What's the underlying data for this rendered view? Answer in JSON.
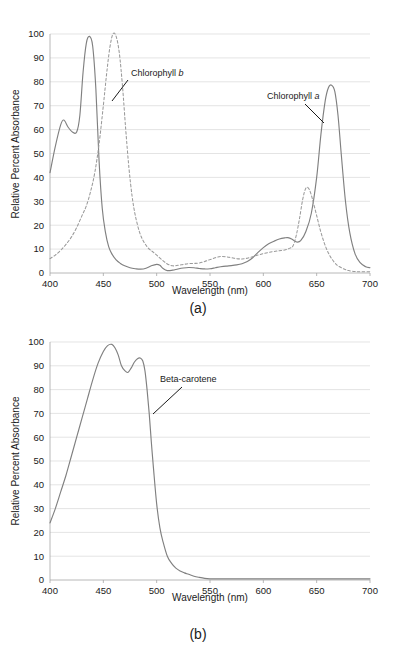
{
  "figure": {
    "panels": [
      {
        "id": "a",
        "caption": "(a)",
        "xlabel": "Wavelength (nm)",
        "ylabel": "Relative Percent Absorbance",
        "xticks": [
          400,
          450,
          500,
          550,
          600,
          650,
          700
        ],
        "yticks": [
          0,
          10,
          20,
          30,
          40,
          50,
          60,
          70,
          80,
          90,
          100
        ],
        "annotations": [
          {
            "name": "chlorophyll-b",
            "text_prefix": "Chlorophyll ",
            "text_italic": "b",
            "text_full": "Chlorophyll b",
            "label_x": 131,
            "label_y": 76,
            "leader": [
              [
                128,
                80
              ],
              [
                112,
                101
              ]
            ]
          },
          {
            "name": "chlorophyll-a",
            "text_prefix": "Chlorophyll ",
            "text_italic": "a",
            "text_full": "Chlorophyll a",
            "label_x": 267,
            "label_y": 99,
            "leader": [
              [
                305,
                104
              ],
              [
                324,
                123
              ]
            ]
          }
        ]
      },
      {
        "id": "b",
        "caption": "(b)",
        "xlabel": "Wavelength (nm)",
        "ylabel": "Relative Percent Absorbance",
        "xticks": [
          400,
          450,
          500,
          550,
          600,
          650,
          700
        ],
        "yticks": [
          0,
          10,
          20,
          30,
          40,
          50,
          60,
          70,
          80,
          90,
          100
        ],
        "annotations": [
          {
            "name": "beta-carotene",
            "text_prefix": "Beta-carotene",
            "text_italic": "",
            "text_full": "Beta-carotene",
            "label_x": 160,
            "label_y": 382,
            "leader": [
              [
                182,
                387
              ],
              [
                153,
                414
              ]
            ]
          }
        ]
      }
    ]
  },
  "chart_data": [
    {
      "type": "line",
      "panel": "a",
      "title": "",
      "xlabel": "Wavelength (nm)",
      "ylabel": "Relative Percent Absorbance",
      "xlim": [
        400,
        700
      ],
      "ylim": [
        0,
        100
      ],
      "grid": true,
      "legend_position": "annotated-inline",
      "series": [
        {
          "name": "Chlorophyll a",
          "style": "solid",
          "color": "#808080",
          "x": [
            400,
            405,
            410,
            413,
            417,
            421,
            425,
            428,
            431,
            434,
            437,
            440,
            443,
            446,
            449,
            452,
            455,
            458,
            462,
            466,
            470,
            475,
            480,
            485,
            490,
            495,
            500,
            503,
            506,
            510,
            515,
            520,
            525,
            530,
            535,
            540,
            545,
            550,
            555,
            560,
            565,
            570,
            575,
            580,
            585,
            590,
            595,
            600,
            605,
            610,
            615,
            620,
            623,
            627,
            631,
            635,
            640,
            645,
            650,
            654,
            658,
            661,
            664,
            667,
            670,
            673,
            677,
            681,
            686,
            691,
            696,
            700
          ],
          "y": [
            42,
            53,
            62,
            64,
            61,
            59,
            59,
            66,
            84,
            96,
            99,
            95,
            77,
            47,
            27,
            17,
            11,
            8,
            5.5,
            4,
            3,
            2.2,
            1.8,
            1.6,
            2.0,
            3.0,
            3.6,
            3.2,
            1.9,
            1.0,
            1.2,
            1.7,
            2.1,
            2.3,
            2.2,
            1.9,
            1.7,
            1.8,
            2.2,
            2.6,
            2.9,
            3.1,
            3.4,
            3.9,
            4.8,
            6.4,
            8.6,
            10.6,
            12.2,
            13.3,
            14.2,
            14.7,
            14.8,
            14.1,
            13.0,
            13.5,
            17.5,
            25.0,
            40.0,
            58.0,
            72.0,
            77.5,
            78.6,
            76.0,
            66.0,
            50.0,
            30.0,
            17.0,
            8.0,
            4.2,
            2.6,
            2.2
          ]
        },
        {
          "name": "Chlorophyll b",
          "style": "dashed",
          "color": "#9a9a9a",
          "x": [
            400,
            405,
            410,
            415,
            420,
            425,
            430,
            434,
            438,
            442,
            446,
            450,
            453,
            456,
            459,
            462,
            465,
            468,
            471,
            474,
            477,
            480,
            484,
            488,
            492,
            496,
            500,
            505,
            510,
            515,
            520,
            525,
            530,
            535,
            540,
            545,
            550,
            555,
            560,
            565,
            570,
            575,
            580,
            585,
            590,
            595,
            600,
            605,
            610,
            615,
            620,
            625,
            628,
            631,
            634,
            637,
            640,
            643,
            646,
            650,
            654,
            658,
            662,
            666,
            670,
            675,
            680,
            686,
            692,
            700
          ],
          "y": [
            6,
            7.5,
            9.5,
            12,
            15,
            19,
            24,
            28,
            34,
            42,
            54,
            70,
            83,
            94,
            100,
            99,
            92,
            78,
            60,
            44,
            32,
            24,
            17,
            13,
            10.5,
            9.0,
            7.5,
            5.5,
            3.8,
            3.0,
            3.2,
            3.6,
            3.9,
            4.0,
            4.2,
            4.8,
            5.6,
            6.4,
            6.9,
            6.8,
            6.4,
            6.0,
            5.9,
            6.2,
            6.8,
            7.5,
            8.1,
            8.6,
            9.0,
            9.3,
            9.6,
            10.4,
            11.5,
            16.0,
            23.0,
            31.0,
            35.6,
            35.0,
            31.0,
            24.0,
            17.0,
            11.5,
            7.5,
            4.8,
            3.0,
            1.8,
            1.0,
            0.6,
            0.5,
            0.5
          ]
        }
      ]
    },
    {
      "type": "line",
      "panel": "b",
      "title": "",
      "xlabel": "Wavelength (nm)",
      "ylabel": "Relative Percent Absorbance",
      "xlim": [
        400,
        700
      ],
      "ylim": [
        0,
        100
      ],
      "grid": true,
      "legend_position": "annotated-inline",
      "series": [
        {
          "name": "Beta-carotene",
          "style": "solid",
          "color": "#808080",
          "x": [
            400,
            405,
            410,
            415,
            420,
            425,
            430,
            435,
            440,
            445,
            450,
            454,
            458,
            461,
            464,
            467,
            470,
            473,
            476,
            479,
            482,
            485,
            487,
            489,
            491,
            493,
            495,
            497,
            500,
            503,
            506,
            510,
            514,
            518,
            522,
            526,
            530,
            535,
            540,
            545,
            550,
            555,
            560,
            570,
            580,
            600,
            620,
            640,
            660,
            680,
            700
          ],
          "y": [
            24,
            30,
            37,
            44,
            52,
            60,
            68,
            76,
            84,
            91,
            96,
            98.5,
            99,
            97.5,
            94.5,
            90,
            88,
            87.2,
            89,
            91.5,
            93,
            93.2,
            92,
            88,
            80,
            70,
            58,
            47,
            32,
            22,
            16,
            10,
            7,
            5,
            3.8,
            3.0,
            2.4,
            1.6,
            1.1,
            0.7,
            0.5,
            0.45,
            0.45,
            0.45,
            0.45,
            0.45,
            0.45,
            0.45,
            0.45,
            0.45,
            0.45
          ]
        }
      ]
    }
  ],
  "geometry": {
    "panel_a": {
      "plot_left": 50,
      "plot_right": 370,
      "plot_top": 34,
      "plot_bottom": 273
    },
    "panel_b": {
      "plot_left": 50,
      "plot_right": 370,
      "plot_top": 16,
      "plot_bottom": 254
    }
  },
  "colors": {
    "gridline": "#d9d9d9",
    "axis": "#a6a6a6",
    "series_solid": "#808080",
    "series_dashed": "#9a9a9a",
    "text": "#1a1a1a",
    "background": "#ffffff"
  }
}
